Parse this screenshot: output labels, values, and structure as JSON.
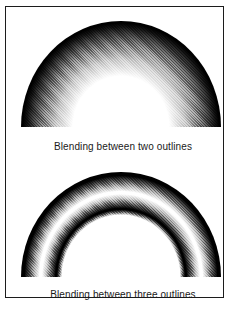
{
  "figure": {
    "top": {
      "caption": "Blending between two outlines",
      "shape": "filled semicircle dome, white center blending radially to black outer edge"
    },
    "bottom": {
      "caption": "Blending between three outlines",
      "shape": "half-annulus arch, black inner and outer edges blending to white mid band"
    }
  },
  "colors": {
    "paper": "#ffffff",
    "ink": "#000000",
    "frame_border": "#1c1c1c",
    "caption_text": "#1a1a1a"
  }
}
